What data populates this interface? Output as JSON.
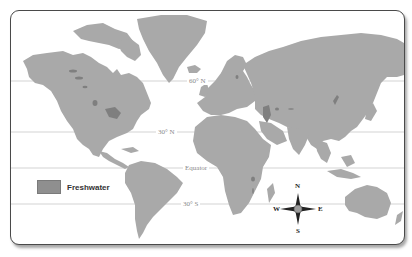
{
  "map": {
    "title": "World Freshwater Map",
    "colors": {
      "land": "#a9a9a9",
      "freshwater": "#7f7f7f",
      "ocean": "#ffffff",
      "latitude_line": "#c8c8c8",
      "frame_border": "#4a4a4a"
    },
    "latitude_lines": [
      {
        "label": "60° N",
        "y": 70
      },
      {
        "label": "30° N",
        "y": 121
      },
      {
        "label": "Equator",
        "y": 157
      },
      {
        "label": "30° S",
        "y": 193
      }
    ],
    "legend": {
      "items": [
        {
          "label": "Freshwater",
          "color": "#8f8f8f"
        }
      ]
    },
    "compass": {
      "icon": "compass-rose-icon",
      "north": "N",
      "south": "S",
      "east": "E",
      "west": "W"
    }
  }
}
